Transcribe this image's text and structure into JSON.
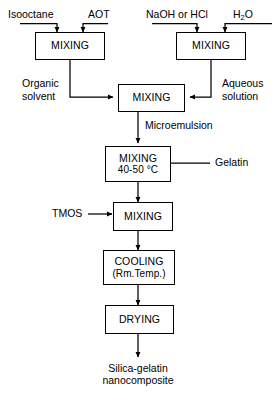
{
  "diagram": {
    "line_color": "#000000",
    "background": "#ffffff"
  },
  "inputs": {
    "isooctane": "Isooctane",
    "aot": "AOT",
    "naoh_or_hcl": "NaOH or HCl",
    "water_prefix": "H",
    "water_subscript": "2",
    "water_suffix": "O",
    "gelatin": "Gelatin",
    "tmos": "TMOS"
  },
  "nodes": {
    "mixing_left": {
      "line1": "MIXING"
    },
    "mixing_right": {
      "line1": "MIXING"
    },
    "mixing_center": {
      "line1": "MIXING"
    },
    "mixing_heated": {
      "line1": "MIXING",
      "line2": "40-50 °C"
    },
    "mixing_tmos": {
      "line1": "MIXING"
    },
    "cooling": {
      "line1": "COOLING",
      "line2": "(Rm.Temp.)"
    },
    "drying": {
      "line1": "DRYING"
    }
  },
  "stream_labels": {
    "organic_solvent": "Organic solvent",
    "aqueous_solution": "Aqueous solution",
    "microemulsion": "Microemulsion"
  },
  "output": {
    "product_line1": "Silica-gelatin",
    "product_line2": "nanocomposite"
  }
}
